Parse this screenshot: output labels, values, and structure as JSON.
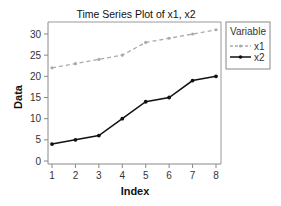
{
  "chart_data": {
    "type": "line",
    "title": "Time Series Plot of x1, x2",
    "xlabel": "Index",
    "ylabel": "Data",
    "x": [
      1,
      2,
      3,
      4,
      5,
      6,
      7,
      8
    ],
    "xticks": [
      "1",
      "2",
      "3",
      "4",
      "5",
      "6",
      "7",
      "8"
    ],
    "yticks": [
      "0",
      "5",
      "10",
      "15",
      "20",
      "25",
      "30"
    ],
    "ylim": [
      0,
      30
    ],
    "grid": false,
    "legend_position": "right",
    "legend_title": "Variable",
    "series": [
      {
        "name": "x1",
        "values": [
          22,
          23,
          24,
          25,
          28,
          29,
          30,
          31
        ],
        "color": "#aaaaaa",
        "style": "dashed"
      },
      {
        "name": "x2",
        "values": [
          4,
          5,
          6,
          10,
          14,
          15,
          19,
          20
        ],
        "color": "#111111",
        "style": "solid"
      }
    ]
  },
  "colors": {
    "axis": "#888888",
    "x1": "#aaaaaa",
    "x2": "#111111"
  }
}
